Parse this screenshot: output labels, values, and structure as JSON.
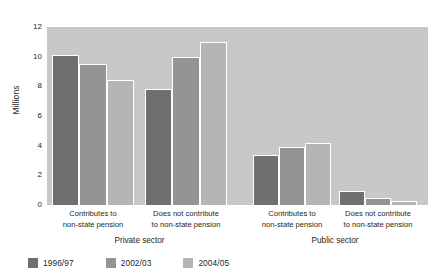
{
  "chart_data": {
    "type": "bar",
    "title": "",
    "xlabel": "",
    "ylabel": "Millions",
    "ylim": [
      0,
      12
    ],
    "yticks": [
      0,
      2,
      4,
      6,
      8,
      10,
      12
    ],
    "grid": false,
    "legend_position": "bottom-left",
    "categories": [
      "Contributes to non-state pension",
      "Does not contribute to non-state pension",
      "Contributes to non-state pension",
      "Does not contribute to non-state pension"
    ],
    "category_lines": [
      [
        "Contributes to",
        "non-state pension"
      ],
      [
        "Does not contribute",
        "to non-state pension"
      ],
      [
        "Contributes to",
        "non-state pension"
      ],
      [
        "Does not contribute",
        "to non-state pension"
      ]
    ],
    "group_labels": [
      "Private sector",
      "Public sector"
    ],
    "series": [
      {
        "name": "1996/97",
        "color": "#6f6f6f",
        "values": [
          10.1,
          7.8,
          3.4,
          0.95
        ]
      },
      {
        "name": "2002/03",
        "color": "#949494",
        "values": [
          9.5,
          10.0,
          3.9,
          0.5
        ]
      },
      {
        "name": "2004/05",
        "color": "#b5b5b5",
        "values": [
          8.4,
          11.0,
          4.2,
          0.3
        ]
      }
    ],
    "plot_background": "#c8c8c8",
    "bar_outline": "#ffffff"
  },
  "axis": {
    "y_label": "Millions",
    "y_ticks": [
      "12",
      "10",
      "8",
      "6",
      "4",
      "2",
      "0"
    ]
  },
  "legend": {
    "items": [
      {
        "label": "1996/97",
        "color": "#6f6f6f"
      },
      {
        "label": "2002/03",
        "color": "#949494"
      },
      {
        "label": "2004/05",
        "color": "#b5b5b5"
      }
    ]
  },
  "sectors": {
    "private": "Private sector",
    "public": "Public sector"
  },
  "top_crop": ""
}
